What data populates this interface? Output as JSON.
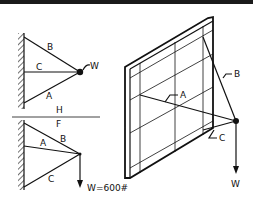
{
  "top_bar": {
    "color": "#1a1a1a"
  },
  "diagram_top": {
    "labels": {
      "B": "B",
      "C": "C",
      "A": "A",
      "W": "W"
    }
  },
  "divider": {
    "above": "H",
    "below": "F"
  },
  "diagram_bottom": {
    "labels": {
      "A": "A",
      "B": "B",
      "C": "C",
      "load": "W=600#"
    }
  },
  "diagram_3d": {
    "labels": {
      "A": "A",
      "B": "B",
      "C": "C",
      "W": "W"
    }
  },
  "colors": {
    "ink": "#111111",
    "background": "#ffffff"
  }
}
